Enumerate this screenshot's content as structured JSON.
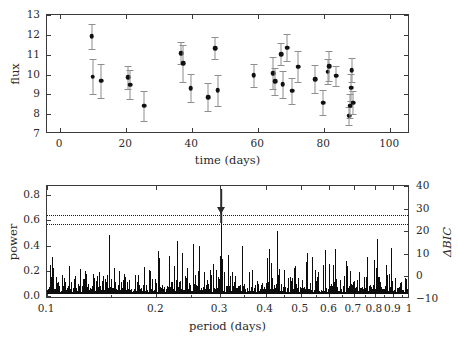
{
  "chart_data": [
    {
      "type": "scatter",
      "title": "",
      "xlabel": "time (days)",
      "ylabel": "flux",
      "xlim": [
        -4,
        106
      ],
      "ylim": [
        7,
        13
      ],
      "xticks": [
        0,
        20,
        40,
        60,
        80,
        100
      ],
      "yticks": [
        7,
        8,
        9,
        10,
        11,
        12,
        13
      ],
      "xticklabels": [
        "0",
        "20",
        "40",
        "60",
        "80",
        "100"
      ],
      "yticklabels": [
        "7",
        "8",
        "9",
        "10",
        "11",
        "12",
        "13"
      ],
      "grid": false,
      "errorbars": true,
      "marker": "filled-circle",
      "marker_color": "#111111",
      "errorbar_color": "#8e8e8e",
      "points": [
        {
          "x": 9.6,
          "y": 11.92,
          "yerr": 0.62
        },
        {
          "x": 9.8,
          "y": 9.88,
          "yerr": 0.88
        },
        {
          "x": 12.5,
          "y": 9.68,
          "yerr": 0.85
        },
        {
          "x": 20.6,
          "y": 9.86,
          "yerr": 0.58
        },
        {
          "x": 21.3,
          "y": 9.49,
          "yerr": 0.74
        },
        {
          "x": 25.5,
          "y": 8.43,
          "yerr": 0.76
        },
        {
          "x": 36.7,
          "y": 11.08,
          "yerr": 0.55
        },
        {
          "x": 37.2,
          "y": 10.56,
          "yerr": 0.95
        },
        {
          "x": 39.6,
          "y": 9.32,
          "yerr": 0.72
        },
        {
          "x": 44.8,
          "y": 8.86,
          "yerr": 0.7
        },
        {
          "x": 47.0,
          "y": 11.32,
          "yerr": 0.55
        },
        {
          "x": 47.7,
          "y": 9.21,
          "yerr": 0.78
        },
        {
          "x": 58.6,
          "y": 9.95,
          "yerr": 0.58
        },
        {
          "x": 64.6,
          "y": 10.08,
          "yerr": 0.8
        },
        {
          "x": 65.1,
          "y": 9.65,
          "yerr": 0.7
        },
        {
          "x": 67.0,
          "y": 11.02,
          "yerr": 0.55
        },
        {
          "x": 67.4,
          "y": 9.52,
          "yerr": 0.68
        },
        {
          "x": 68.7,
          "y": 11.35,
          "yerr": 0.68
        },
        {
          "x": 70.3,
          "y": 9.18,
          "yerr": 0.65
        },
        {
          "x": 72.1,
          "y": 10.39,
          "yerr": 0.78
        },
        {
          "x": 77.3,
          "y": 9.77,
          "yerr": 0.72
        },
        {
          "x": 79.7,
          "y": 8.58,
          "yerr": 0.62
        },
        {
          "x": 81.0,
          "y": 10.15,
          "yerr": 0.62
        },
        {
          "x": 81.5,
          "y": 10.43,
          "yerr": 0.75
        },
        {
          "x": 83.6,
          "y": 9.93,
          "yerr": 0.52
        },
        {
          "x": 87.6,
          "y": 7.92,
          "yerr": 0.45
        },
        {
          "x": 87.9,
          "y": 8.42,
          "yerr": 0.62
        },
        {
          "x": 88.1,
          "y": 9.33,
          "yerr": 0.68
        },
        {
          "x": 88.3,
          "y": 10.23,
          "yerr": 0.6
        },
        {
          "x": 88.7,
          "y": 8.58,
          "yerr": 0.58
        }
      ]
    },
    {
      "type": "line",
      "title": "",
      "xlabel": "period (days)",
      "ylabel": "power",
      "y2label": "ΔBIC",
      "xscale": "log",
      "xlim": [
        0.1,
        1.0
      ],
      "ylim": [
        -0.02,
        0.87
      ],
      "y2lim": [
        -10,
        40
      ],
      "xticks": [
        0.1,
        0.2,
        0.3,
        0.4,
        0.5,
        0.6,
        0.7,
        0.8,
        0.9,
        1.0
      ],
      "xticklabels": [
        "0.1",
        "0.2",
        "0.3",
        "0.4",
        "0.5",
        "0.6",
        "0.7",
        "0.8",
        "0.9",
        "1"
      ],
      "yticks": [
        0.0,
        0.2,
        0.4,
        0.6,
        0.8
      ],
      "yticklabels": [
        "0.0",
        "0.2",
        "0.4",
        "0.6",
        "0.8"
      ],
      "y2ticks": [
        -10,
        0,
        10,
        20,
        30,
        40
      ],
      "y2ticklabels": [
        "−10",
        "0",
        "10",
        "20",
        "30",
        "40"
      ],
      "grid": false,
      "line_color": "#0d0d0d",
      "thresholds": [
        {
          "power": 0.645,
          "delta_bic": 29,
          "style": "dotted"
        },
        {
          "power": 0.57,
          "delta_bic": 25,
          "style": "dotted"
        }
      ],
      "annotations": [
        {
          "type": "arrow",
          "direction": "down",
          "x": 0.302,
          "y_start": 0.845,
          "y_end": 0.575,
          "label": ""
        }
      ],
      "peak": {
        "period": 0.302,
        "power": 0.575
      },
      "noise_floor": 0.02,
      "typical_power": 0.12
    }
  ]
}
